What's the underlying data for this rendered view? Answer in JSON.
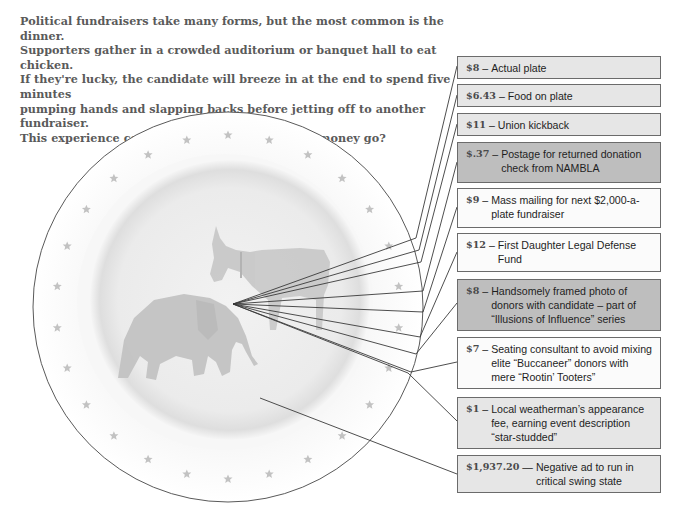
{
  "intro": {
    "lines": [
      "Political fundraisers take many forms, but the most common is the dinner.",
      "Supporters gather in a crowded auditorium or banquet hall to eat chicken.",
      "If they're lucky, the candidate will breeze in at the end to spend five minutes",
      "pumping hands and slapping backs before jetting off to another fundraiser.",
      "This experience costs $2,000. Where does that money go?"
    ]
  },
  "total_cost": "$2,000",
  "plate": {
    "illustration": [
      "donkey-icon",
      "elephant-icon"
    ],
    "rim_decoration": "star-icon"
  },
  "colors": {
    "box_light": "#e6e6e6",
    "box_dark": "#bebebe",
    "box_white": "#fbfbfb",
    "border": "#6b6b6b",
    "intro_text": "#5a5a5a"
  },
  "items": [
    {
      "amount": "$8",
      "description": "Actual plate",
      "shade": "light"
    },
    {
      "amount": "$6.43",
      "description": "Food on plate",
      "shade": "light"
    },
    {
      "amount": "$11",
      "description": "Union kickback",
      "shade": "light"
    },
    {
      "amount": "$.37",
      "description": "Postage for returned donation check from NAMBLA",
      "shade": "dark"
    },
    {
      "amount": "$9",
      "description": "Mass mailing for next $2,000-a-plate fundraiser",
      "shade": "white"
    },
    {
      "amount": "$12",
      "description": "First Daughter Legal Defense Fund",
      "shade": "white"
    },
    {
      "amount": "$8",
      "description": "Handsomely framed photo of donors with candidate – part of “Illusions of Influence” series",
      "shade": "dark"
    },
    {
      "amount": "$7",
      "description": "Seating consultant to avoid mixing elite “Buccaneer” donors with mere “Rootin’ Tooters”",
      "shade": "white"
    },
    {
      "amount": "$1",
      "description": "Local weatherman’s appearance fee, earning event description “star-studded”",
      "shade": "light"
    },
    {
      "amount": "$1,937.20",
      "description": "Negative ad to run in critical swing state",
      "shade": "light"
    }
  ]
}
